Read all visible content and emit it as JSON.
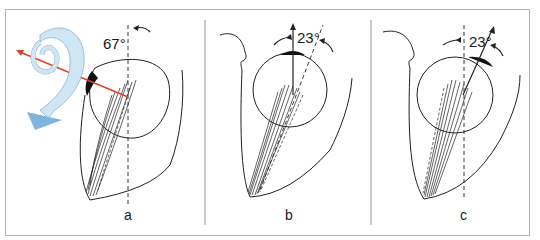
{
  "figure": {
    "panels": [
      {
        "id": "a",
        "label": "a",
        "angle": "67°"
      },
      {
        "id": "b",
        "label": "b",
        "angle": "23°"
      },
      {
        "id": "c",
        "label": "c",
        "angle": "23°"
      }
    ],
    "icons": {
      "rotation_ribbon": "spiral-ribbon-arrow-icon",
      "axis_arrow": "red-axis-arrow-icon"
    },
    "colors": {
      "ribbon_fill": "#cfe6f5",
      "ribbon_stroke": "#8fb3cc",
      "ribbon_arrowhead": "#7fb3e0",
      "axis_red": "#d9442a",
      "line": "#222222",
      "frame": "#b4b4b4",
      "divider": "#a8a8a8"
    }
  }
}
